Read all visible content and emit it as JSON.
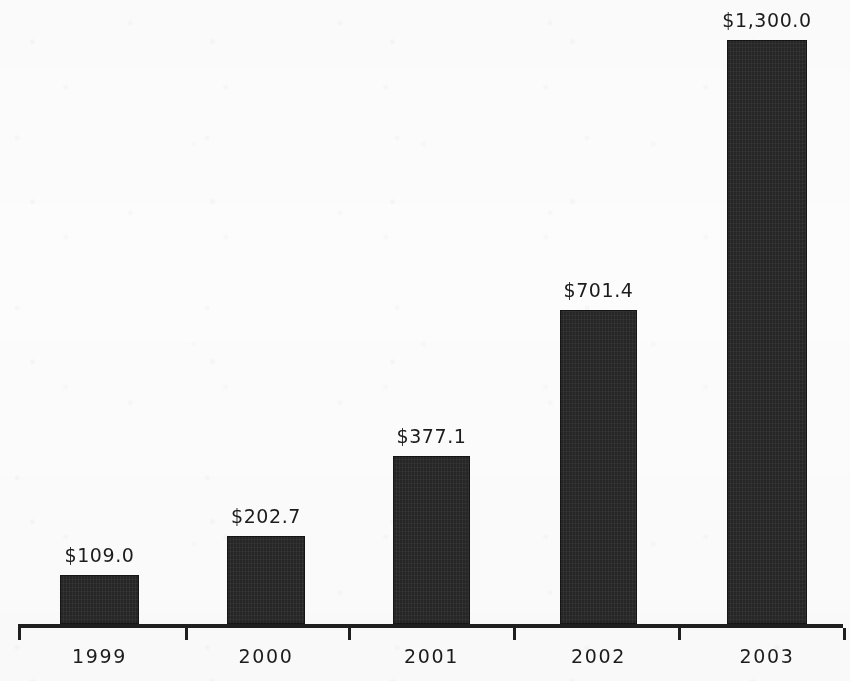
{
  "chart_data": {
    "type": "bar",
    "title": "",
    "subtitle": "",
    "xlabel": "",
    "ylabel": "",
    "categories": [
      "1999",
      "2000",
      "2001",
      "2002",
      "2003"
    ],
    "values": [
      109.0,
      202.7,
      377.1,
      701.4,
      1300.0
    ],
    "data_labels": [
      "$109.0",
      "$202.7",
      "$377.1",
      "$701.4",
      "$1,300.0"
    ],
    "series": [
      {
        "name": "",
        "values": [
          109.0,
          202.7,
          377.1,
          701.4,
          1300.0
        ]
      }
    ],
    "ylim": [
      0,
      1300
    ],
    "grid": false,
    "legend": false,
    "legend_position": "none",
    "y_axis_visible": false,
    "x_axis_visible": true,
    "annotations": [],
    "colors": {
      "bar_fill": "#262626",
      "axis": "#1f1f1f",
      "text": "#1c1c1c",
      "background": "#fcfcfc"
    }
  },
  "bars": [
    {
      "category": "1999",
      "value": 109.0,
      "label": "$109.0",
      "x": 60,
      "width": 79,
      "top": 575,
      "height": 49,
      "center": 99.5
    },
    {
      "category": "2000",
      "value": 202.7,
      "label": "$202.7",
      "x": 227,
      "width": 78,
      "top": 536,
      "height": 88,
      "center": 266
    },
    {
      "category": "2001",
      "value": 377.1,
      "label": "$377.1",
      "x": 393,
      "width": 77,
      "top": 456,
      "height": 168,
      "center": 431.5
    },
    {
      "category": "2002",
      "value": 701.4,
      "label": "$701.4",
      "x": 560,
      "width": 77,
      "top": 310,
      "height": 314,
      "center": 598.5
    },
    {
      "category": "2003",
      "value": 1300.0,
      "label": "$1,300.0",
      "x": 727,
      "width": 80,
      "top": 40,
      "height": 584,
      "center": 767
    }
  ],
  "axis": {
    "baseline_y": 624,
    "start_x": 18,
    "end_x": 843,
    "thickness": 4,
    "tick_positions": [
      18,
      185,
      348,
      513,
      678,
      843
    ],
    "tick_length": 12
  },
  "category_label_y": 645
}
